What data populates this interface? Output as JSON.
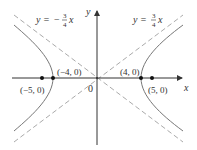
{
  "diagram": {
    "axes": {
      "x_label": "x",
      "y_label": "y",
      "origin_label": "0"
    },
    "asymptotes": [
      {
        "label_lhs": "y = ",
        "sign": "−",
        "num": "3",
        "den": "4",
        "var": "x",
        "slope": -0.75
      },
      {
        "label_lhs": "y = ",
        "sign": "",
        "num": "3",
        "den": "4",
        "var": "x",
        "slope": 0.75
      }
    ],
    "points": [
      {
        "label": "(−5, 0)",
        "x": -5,
        "y": 0,
        "type": "focus"
      },
      {
        "label": "(−4, 0)",
        "x": -4,
        "y": 0,
        "type": "vertex"
      },
      {
        "label": "(4, 0)",
        "x": 4,
        "y": 0,
        "type": "vertex"
      },
      {
        "label": "(5, 0)",
        "x": 5,
        "y": 0,
        "type": "focus"
      }
    ],
    "colors": {
      "axis": "#333333",
      "curve": "#777777",
      "asymptote": "#aaaaaa",
      "point": "#111111"
    }
  }
}
